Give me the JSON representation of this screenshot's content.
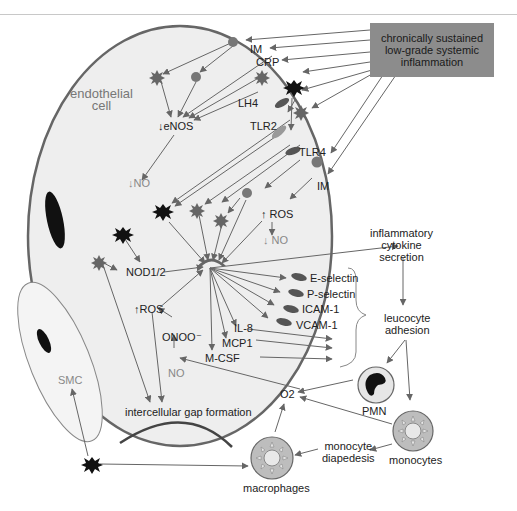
{
  "source_box": {
    "line1": "chronically sustained",
    "line2": "low-grade systemic",
    "line3": "inflammation",
    "color": "#8c8c8c"
  },
  "cell_label": {
    "line1": "endothelial",
    "line2": "cell"
  },
  "mediators": {
    "im_top": "IM",
    "crp": "CRP",
    "lh4": "LH4",
    "tlr2": "TLR2",
    "tlr4": "TLR4",
    "im_right": "IM",
    "enos": "↓eNOS",
    "no_left": "↓NO",
    "ros_right": "↑ ROS",
    "no_right": "↓ NO",
    "nod": "NOD1/2",
    "ros_lower": "↑ROS",
    "onoo": "ONOO⁻",
    "no_lower": "NO",
    "il8": "IL-8",
    "mcp1": "MCP1",
    "mcsf": "M-CSF"
  },
  "adhesion_molecules": [
    "E-selectin",
    "P-selectin",
    "ICAM-1",
    "VCAM-1"
  ],
  "outcomes": {
    "cytokine": {
      "line1": "inflammatory",
      "line2": "cytokine",
      "line3": "secretion"
    },
    "adhesion": {
      "line1": "leucocyte",
      "line2": "adhesion"
    },
    "pmn": "PMN",
    "o2": "O2",
    "monocytes": "monocytes",
    "diapedesis": {
      "line1": "monocyte",
      "line2": "diapedesis"
    },
    "macrophages": "macrophages",
    "gap": "intercellular gap formation",
    "smc": "SMC"
  },
  "colors": {
    "arrow": "#666666",
    "cell_fill": "#eeeeee",
    "cell_border": "#666666",
    "dark_marker": "#111111",
    "gray_marker": "#777777"
  }
}
